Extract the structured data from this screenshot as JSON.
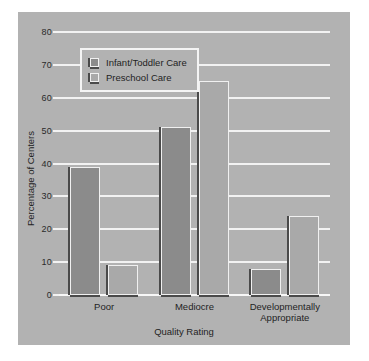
{
  "chart_data": {
    "type": "bar",
    "title": "",
    "xlabel": "Quality Rating",
    "ylabel": "Percentage of Centers",
    "categories": [
      "Poor",
      "Mediocre",
      "Developmentally\nAppropriate"
    ],
    "series": [
      {
        "name": "Infant/Toddler Care",
        "values": [
          39,
          51,
          8
        ],
        "color": "#8b8b8b"
      },
      {
        "name": "Preschool Care",
        "values": [
          9,
          65,
          24
        ],
        "color": "#a9a9a9"
      }
    ],
    "ylim": [
      0,
      80
    ],
    "yticks": [
      0,
      10,
      20,
      30,
      40,
      50,
      60,
      70,
      80
    ],
    "ytick_labels": [
      "0",
      "10",
      "20",
      "30",
      "40",
      "50",
      "60",
      "70",
      "80"
    ],
    "grid": true,
    "legend_position": "upper left",
    "panel_color": "#b2b2b2",
    "grid_color": "#f2f2f2"
  }
}
